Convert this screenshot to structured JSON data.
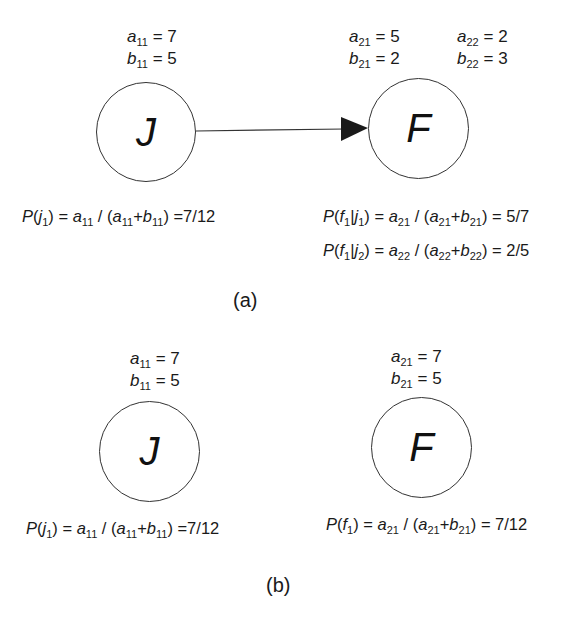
{
  "panels": {
    "a": {
      "caption": "(a)",
      "nodes": {
        "J": {
          "label": "J",
          "params": [
            {
              "var": "a",
              "sub": "11",
              "value": "7"
            },
            {
              "var": "b",
              "sub": "11",
              "value": "5"
            }
          ],
          "formula": {
            "lhs": "P",
            "arg": "j",
            "arg_sub": "1",
            "num": "a",
            "num_sub": "11",
            "d1": "a",
            "d1_sub": "11",
            "d2": "b",
            "d2_sub": "11",
            "result": "=7/12"
          }
        },
        "F": {
          "label": "F",
          "params_col1": [
            {
              "var": "a",
              "sub": "21",
              "value": "5"
            },
            {
              "var": "b",
              "sub": "21",
              "value": "2"
            }
          ],
          "params_col2": [
            {
              "var": "a",
              "sub": "22",
              "value": "2"
            },
            {
              "var": "b",
              "sub": "22",
              "value": "3"
            }
          ],
          "formulas": [
            {
              "lhs": "P",
              "f": "f",
              "f_sub": "1",
              "cond": "j",
              "cond_sub": "1",
              "num": "a",
              "num_sub": "21",
              "d1": "a",
              "d1_sub": "21",
              "d2": "b",
              "d2_sub": "21",
              "result": "= 5/7"
            },
            {
              "lhs": "P",
              "f": "f",
              "f_sub": "1",
              "cond": "j",
              "cond_sub": "2",
              "num": "a",
              "num_sub": "22",
              "d1": "a",
              "d1_sub": "22",
              "d2": "b",
              "d2_sub": "22",
              "result": "= 2/5"
            }
          ]
        }
      },
      "edge": {
        "from": "J",
        "to": "F"
      }
    },
    "b": {
      "caption": "(b)",
      "nodes": {
        "J": {
          "label": "J",
          "params": [
            {
              "var": "a",
              "sub": "11",
              "value": "7"
            },
            {
              "var": "b",
              "sub": "11",
              "value": "5"
            }
          ],
          "formula": {
            "lhs": "P",
            "arg": "j",
            "arg_sub": "1",
            "num": "a",
            "num_sub": "11",
            "d1": "a",
            "d1_sub": "11",
            "d2": "b",
            "d2_sub": "11",
            "result": "=7/12"
          }
        },
        "F": {
          "label": "F",
          "params": [
            {
              "var": "a",
              "sub": "21",
              "value": "7"
            },
            {
              "var": "b",
              "sub": "21",
              "value": "5"
            }
          ],
          "formula": {
            "lhs": "P",
            "arg": "f",
            "arg_sub": "1",
            "num": "a",
            "num_sub": "21",
            "d1": "a",
            "d1_sub": "21",
            "d2": "b",
            "d2_sub": "21",
            "result": "= 7/12"
          }
        }
      }
    }
  },
  "symbols": {
    "eq": "=",
    "slash": "/",
    "open": "(",
    "close": ")",
    "plus": "+",
    "bar": "|"
  }
}
